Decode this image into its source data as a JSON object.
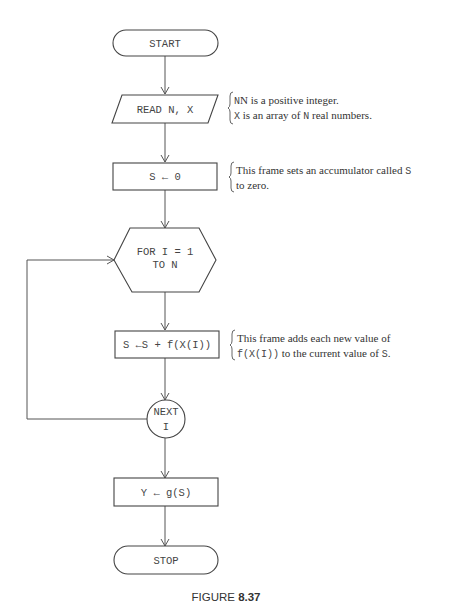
{
  "flowchart": {
    "start": {
      "label": "START",
      "shape": "terminal"
    },
    "read": {
      "label": "READ N, X",
      "shape": "input-output"
    },
    "init": {
      "label": "S ← 0",
      "shape": "process"
    },
    "loop": {
      "line1": "FOR I = 1",
      "line2": "TO N",
      "shape": "preparation"
    },
    "accumulate": {
      "label": "S ←S + f(X(I))",
      "shape": "process"
    },
    "next": {
      "line1": "NEXT",
      "line2": "I",
      "shape": "connector"
    },
    "result": {
      "label": "Y ← g(S)",
      "shape": "process"
    },
    "stop": {
      "label": "STOP",
      "shape": "terminal"
    }
  },
  "annotations": {
    "read": {
      "line1": "N is a positive integer.",
      "line2_prefix": "X",
      "line2_mid": " is an array of ",
      "line2_var": "N",
      "line2_suffix": " real numbers."
    },
    "init": {
      "line1_text": "This frame sets an accumulator called ",
      "line1_var": "S",
      "line2": "to zero."
    },
    "accumulate": {
      "line1": "This frame adds each new value of",
      "line2_code": "f(X(I))",
      "line2_text": " to the current value of ",
      "line2_var": "S",
      "line2_end": "."
    }
  },
  "caption": {
    "prefix": "FIGURE ",
    "number": "8.37"
  }
}
